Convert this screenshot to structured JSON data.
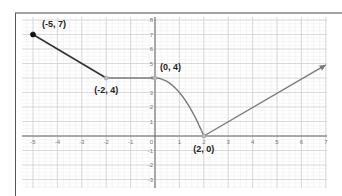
{
  "chart_data": {
    "type": "line",
    "title": "",
    "xlabel": "",
    "ylabel": "",
    "xlim": [
      -5.7,
      7
    ],
    "ylim": [
      -3.8,
      8.4
    ],
    "grid": true,
    "x_ticks": [
      "-5",
      "-4",
      "-3",
      "-2",
      "-1",
      "0",
      "1",
      "2",
      "3",
      "4",
      "5",
      "6",
      "7"
    ],
    "y_ticks": [
      "8",
      "7",
      "6",
      "5",
      "4",
      "3",
      "2",
      "1",
      "0",
      "-1",
      "-2",
      "-3"
    ],
    "series": [
      {
        "name": "piecewise function",
        "segments": [
          {
            "kind": "line",
            "from": [
              -5,
              7
            ],
            "to": [
              -2,
              4
            ],
            "start": "closed-dot"
          },
          {
            "kind": "line",
            "from": [
              -2,
              4
            ],
            "to": [
              0,
              4
            ]
          },
          {
            "kind": "curve",
            "from": [
              0,
              4
            ],
            "to": [
              2,
              0
            ]
          },
          {
            "kind": "ray",
            "from": [
              2,
              0
            ],
            "to": [
              7,
              4.9
            ],
            "end": "arrow"
          }
        ],
        "points": [
          [
            -5,
            7
          ],
          [
            -2,
            4
          ],
          [
            0,
            4
          ],
          [
            2,
            0
          ]
        ]
      }
    ],
    "annotations": [
      {
        "text": "(-5, 7)",
        "at": [
          -5,
          7
        ]
      },
      {
        "text": "(-2, 4)",
        "at": [
          -2,
          4
        ]
      },
      {
        "text": "(0, 4)",
        "at": [
          0,
          4
        ]
      },
      {
        "text": "(2, 0)",
        "at": [
          2,
          0
        ]
      }
    ],
    "colors": {
      "line_dark": "#333333",
      "line_gray": "#7a7a7a",
      "grid_major": "#cfcfcf",
      "grid_minor": "#ececec",
      "axis": "#666666",
      "frame": "#444444"
    }
  }
}
